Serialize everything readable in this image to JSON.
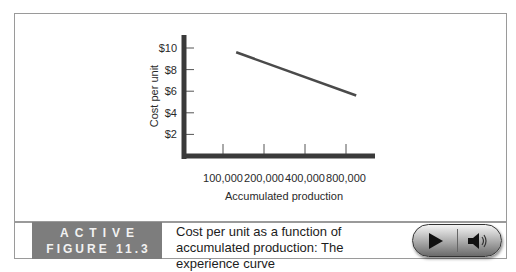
{
  "chart_data": {
    "type": "line",
    "title": "",
    "xlabel": "Accumulated production",
    "ylabel": "Cost per unit",
    "x_ticks": [
      "100,000",
      "200,000",
      "400,000",
      "800,000"
    ],
    "y_ticks": [
      "$2",
      "$4",
      "$6",
      "$8",
      "$10"
    ],
    "y_tick_values": [
      2,
      4,
      6,
      8,
      10
    ],
    "ylim": [
      0,
      11.5
    ],
    "x_scale": "log2 (tick positions evenly spaced)",
    "series": [
      {
        "name": "Experience curve",
        "points": [
          {
            "x": 125000,
            "y": 9.6
          },
          {
            "x": 950000,
            "y": 5.6
          }
        ]
      }
    ],
    "grid": false,
    "legend": "none"
  },
  "caption": {
    "tag_line1": "ACTIVE",
    "tag_line2": "FIGURE 11.3",
    "text": "Cost per unit as a function of accumulated production: The experience curve"
  },
  "media_controls": {
    "play_icon": "play-icon",
    "audio_icon": "speaker-icon"
  },
  "colors": {
    "axis": "#3a3a3a",
    "line": "#4a4a4a",
    "tag_background": "#7d7d7d"
  }
}
